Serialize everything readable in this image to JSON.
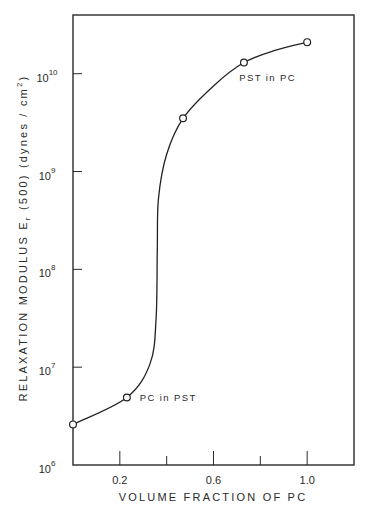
{
  "chart_data": {
    "type": "line",
    "title": "",
    "xlabel": "VOLUME FRACTION OF PC",
    "ylabel": {
      "prefix": "RELAXATION MODULUS  E",
      "subscript": "r",
      "middle": " (500) (dynes / cm",
      "superscript": "2",
      "suffix": ")"
    },
    "xlim": [
      0.0,
      1.2
    ],
    "ylim_log10": [
      6,
      10.6
    ],
    "yscale": "log",
    "grid": false,
    "x_ticks": [
      {
        "value": 0.2,
        "label": "0.2"
      },
      {
        "value": 0.4,
        "label": ""
      },
      {
        "value": 0.6,
        "label": "0.6"
      },
      {
        "value": 0.8,
        "label": ""
      },
      {
        "value": 1.0,
        "label": "1.0"
      }
    ],
    "y_ticks": [
      {
        "value_log10": 6,
        "base": "10",
        "exp": "6"
      },
      {
        "value_log10": 7,
        "base": "10",
        "exp": "7"
      },
      {
        "value_log10": 8,
        "base": "10",
        "exp": "8"
      },
      {
        "value_log10": 9,
        "base": "10",
        "exp": "9"
      },
      {
        "value_log10": 10,
        "base": "10",
        "exp": "10"
      }
    ],
    "series": [
      {
        "name": "Er(500)",
        "marker": "open-circle",
        "x": [
          0.0,
          0.23,
          0.47,
          0.73,
          1.0
        ],
        "y": [
          2600000.0,
          4900000.0,
          3500000000.0,
          13000000000.0,
          21000000000.0
        ]
      }
    ],
    "fit_curve": {
      "x": [
        0.0,
        0.23,
        0.33,
        0.355,
        0.36,
        0.365,
        0.4,
        0.47,
        0.6,
        0.73,
        0.87,
        1.0
      ],
      "y": [
        2600000.0,
        4900000.0,
        11000000.0,
        32000000.0,
        160000000.0,
        530000000.0,
        1500000000.0,
        3500000000.0,
        7500000000.0,
        13000000000.0,
        17500000000.0,
        21000000000.0
      ]
    },
    "annotations": [
      {
        "text": "PST in PC",
        "x": 0.71,
        "y": 8500000000.0
      },
      {
        "text": "PC in PST",
        "x": 0.285,
        "y": 4500000.0
      }
    ]
  }
}
